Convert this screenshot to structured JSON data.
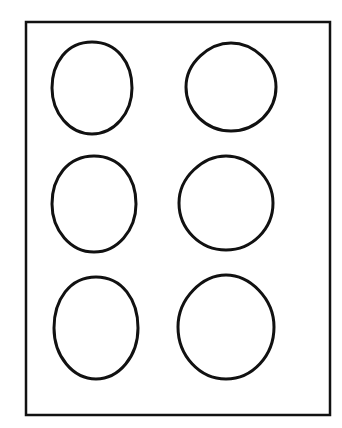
{
  "diagram": {
    "stroke_color": "#111111",
    "background": "#ffffff",
    "frame": {
      "x": 26,
      "y": 22,
      "width": 304,
      "height": 393
    },
    "ovals": [
      {
        "row": 1,
        "col": 1,
        "cx": 92,
        "cy": 88,
        "rx": 40,
        "ry": 46
      },
      {
        "row": 1,
        "col": 2,
        "cx": 231,
        "cy": 87,
        "rx": 45,
        "ry": 44
      },
      {
        "row": 2,
        "col": 1,
        "cx": 94,
        "cy": 204,
        "rx": 42,
        "ry": 48
      },
      {
        "row": 2,
        "col": 2,
        "cx": 226,
        "cy": 203,
        "rx": 47,
        "ry": 47
      },
      {
        "row": 3,
        "col": 1,
        "cx": 96,
        "cy": 328,
        "rx": 42,
        "ry": 51
      },
      {
        "row": 3,
        "col": 2,
        "cx": 226,
        "cy": 327,
        "rx": 48,
        "ry": 52
      }
    ]
  }
}
